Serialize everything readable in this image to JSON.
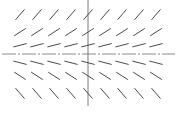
{
  "chart_data": {
    "type": "slope-field",
    "title": "",
    "xlabel": "",
    "ylabel": "",
    "equation_shown": "",
    "slope_rule": "dy/dx = 0.5 * y",
    "x_values": [
      -4,
      -3,
      -2,
      -1,
      0,
      1,
      2,
      3,
      4
    ],
    "y_values": [
      2.25,
      1.25,
      0.5,
      -0.5,
      -1.25,
      -2.25
    ],
    "xlim": [
      -5,
      5
    ],
    "ylim": [
      -3,
      3
    ],
    "axes": {
      "horizontal_style": "dash-dot",
      "vertical_style": "solid"
    },
    "grid": false,
    "legend": "none",
    "colors": {
      "segments": "#4a4a4a",
      "axes": "#8a8a8a"
    }
  }
}
